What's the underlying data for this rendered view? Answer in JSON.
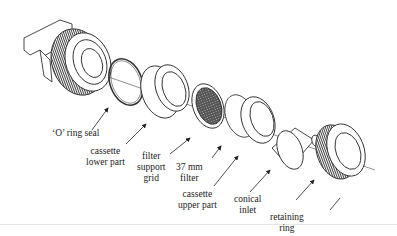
{
  "diagram": {
    "parts": [
      {
        "id": "o-ring-seal",
        "lines": [
          "'O' ring seal"
        ]
      },
      {
        "id": "cassette-lower-part",
        "lines": [
          "cassette",
          "lower part"
        ]
      },
      {
        "id": "filter-support-grid",
        "lines": [
          "filter",
          "support",
          "grid"
        ]
      },
      {
        "id": "37mm-filter",
        "lines": [
          "37 mm",
          "filter"
        ]
      },
      {
        "id": "cassette-upper-part",
        "lines": [
          "cassette",
          "upper part"
        ]
      },
      {
        "id": "conical-inlet",
        "lines": [
          "conical",
          "inlet"
        ]
      },
      {
        "id": "retaining-ring",
        "lines": [
          "retaining",
          "ring"
        ]
      }
    ]
  },
  "labels": {
    "o_ring": "‘O’ ring seal",
    "lower_1": "cassette",
    "lower_2": "lower part",
    "grid_1": "filter",
    "grid_2": "support",
    "grid_3": "grid",
    "filter_1": "37 mm",
    "filter_2": "filter",
    "upper_1": "cassette",
    "upper_2": "upper part",
    "inlet_1": "conical",
    "inlet_2": "inlet",
    "ring_1": "retaining",
    "ring_2": "ring"
  },
  "colors": {
    "stroke": "#333333",
    "background": "#ffffff"
  }
}
